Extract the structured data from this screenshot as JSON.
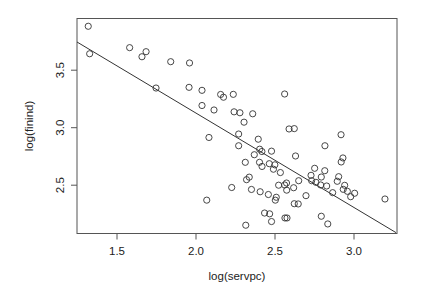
{
  "chart_data": {
    "type": "scatter",
    "title": "",
    "xlabel": "log(servpc)",
    "ylabel": "log(finind)",
    "xlim": [
      1.247,
      3.266
    ],
    "ylim": [
      2.087,
      3.962
    ],
    "x_ticks": [
      1.5,
      2.0,
      2.5,
      3.0
    ],
    "x_tick_labels": [
      "1.5",
      "2.0",
      "2.5",
      "3.0"
    ],
    "y_ticks": [
      2.5,
      3.0,
      3.5
    ],
    "y_tick_labels": [
      "2.5",
      "3.0",
      "3.5"
    ],
    "grid": false,
    "legend": null,
    "marker": "open-circle",
    "fit_line": {
      "intercept": 4.769,
      "slope": -0.821,
      "x_start": 1.247,
      "x_end": 3.266
    },
    "points": [
      [
        1.318,
        3.882
      ],
      [
        1.327,
        3.643
      ],
      [
        1.58,
        3.696
      ],
      [
        1.658,
        3.617
      ],
      [
        1.684,
        3.661
      ],
      [
        1.84,
        3.574
      ],
      [
        1.747,
        3.345
      ],
      [
        1.959,
        3.563
      ],
      [
        1.956,
        3.351
      ],
      [
        2.038,
        3.325
      ],
      [
        2.156,
        3.289
      ],
      [
        2.174,
        3.265
      ],
      [
        2.236,
        3.29
      ],
      [
        2.561,
        3.293
      ],
      [
        2.038,
        3.193
      ],
      [
        2.114,
        3.154
      ],
      [
        2.241,
        3.138
      ],
      [
        2.278,
        3.13
      ],
      [
        2.359,
        3.121
      ],
      [
        2.304,
        3.048
      ],
      [
        2.082,
        2.915
      ],
      [
        2.27,
        2.945
      ],
      [
        2.394,
        2.9
      ],
      [
        2.589,
        2.989
      ],
      [
        2.622,
        2.992
      ],
      [
        2.27,
        2.843
      ],
      [
        2.403,
        2.813
      ],
      [
        2.417,
        2.793
      ],
      [
        2.478,
        2.796
      ],
      [
        2.369,
        2.765
      ],
      [
        2.63,
        2.754
      ],
      [
        2.312,
        2.699
      ],
      [
        2.402,
        2.699
      ],
      [
        2.464,
        2.687
      ],
      [
        2.499,
        2.677
      ],
      [
        2.418,
        2.663
      ],
      [
        2.49,
        2.639
      ],
      [
        2.534,
        2.61
      ],
      [
        2.337,
        2.57
      ],
      [
        2.32,
        2.548
      ],
      [
        2.65,
        2.539
      ],
      [
        2.573,
        2.519
      ],
      [
        2.226,
        2.48
      ],
      [
        2.523,
        2.5
      ],
      [
        2.561,
        2.502
      ],
      [
        2.351,
        2.463
      ],
      [
        2.406,
        2.443
      ],
      [
        2.618,
        2.478
      ],
      [
        2.574,
        2.457
      ],
      [
        2.458,
        2.419
      ],
      [
        2.508,
        2.395
      ],
      [
        2.502,
        2.37
      ],
      [
        2.068,
        2.37
      ],
      [
        2.622,
        2.339
      ],
      [
        2.647,
        2.337
      ],
      [
        2.434,
        2.258
      ],
      [
        2.466,
        2.251
      ],
      [
        2.478,
        2.184
      ],
      [
        2.563,
        2.215
      ],
      [
        2.576,
        2.215
      ],
      [
        2.315,
        2.152
      ],
      [
        2.93,
        2.737
      ],
      [
        2.919,
        2.702
      ],
      [
        2.751,
        2.647
      ],
      [
        2.815,
        2.626
      ],
      [
        2.728,
        2.586
      ],
      [
        2.793,
        2.571
      ],
      [
        2.903,
        2.574
      ],
      [
        2.894,
        2.534
      ],
      [
        2.732,
        2.539
      ],
      [
        2.759,
        2.525
      ],
      [
        2.789,
        2.502
      ],
      [
        2.827,
        2.493
      ],
      [
        2.941,
        2.499
      ],
      [
        2.932,
        2.464
      ],
      [
        2.958,
        2.447
      ],
      [
        3.004,
        2.43
      ],
      [
        2.979,
        2.4
      ],
      [
        2.865,
        2.435
      ],
      [
        2.696,
        2.409
      ],
      [
        2.918,
        2.939
      ],
      [
        2.816,
        2.843
      ],
      [
        3.196,
        2.38
      ],
      [
        2.793,
        2.23
      ],
      [
        2.834,
        2.163
      ]
    ]
  },
  "plot": {
    "x_axis_title": "log(servpc)",
    "y_axis_title": "log(finind)"
  }
}
